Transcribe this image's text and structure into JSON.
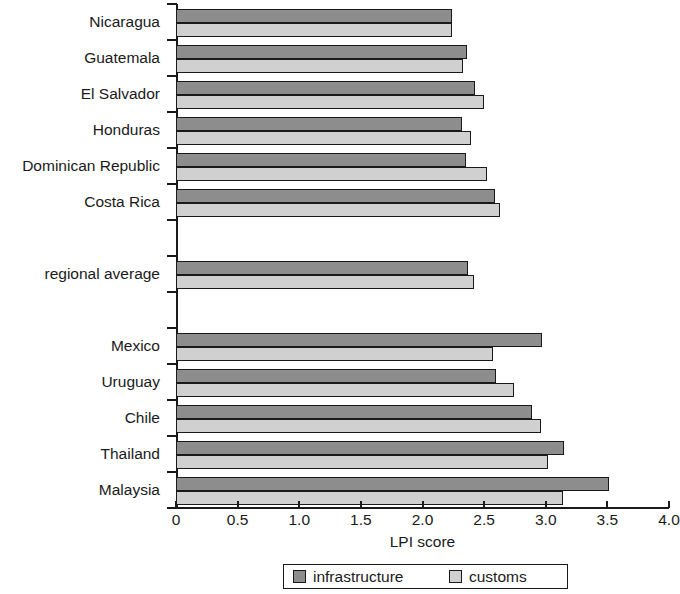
{
  "chart_data": {
    "type": "bar",
    "orientation": "horizontal",
    "title": "",
    "xlabel": "LPI score",
    "ylabel": "",
    "xlim": [
      0,
      4.0
    ],
    "xticks": [
      "0",
      "0.5",
      "1.0",
      "1.5",
      "2.0",
      "2.5",
      "3.0",
      "3.5",
      "4.0"
    ],
    "xtick_values": [
      0,
      0.5,
      1.0,
      1.5,
      2.0,
      2.5,
      3.0,
      3.5,
      4.0
    ],
    "grid": false,
    "legend_position": "bottom",
    "categories": [
      "Nicaragua",
      "Guatemala",
      "El Salvador",
      "Honduras",
      "Dominican Republic",
      "Costa Rica",
      "",
      "regional average",
      "",
      "Mexico",
      "Uruguay",
      "Chile",
      "Thailand",
      "Malaysia"
    ],
    "series": [
      {
        "name": "infrastructure",
        "color": "#8d8d8d",
        "values": [
          2.24,
          2.36,
          2.43,
          2.32,
          2.35,
          2.59,
          null,
          2.37,
          null,
          2.97,
          2.6,
          2.89,
          3.15,
          3.51
        ]
      },
      {
        "name": "customs",
        "color": "#d0d0d0",
        "values": [
          2.24,
          2.33,
          2.5,
          2.39,
          2.52,
          2.63,
          null,
          2.42,
          null,
          2.57,
          2.74,
          2.96,
          3.02,
          3.14
        ]
      }
    ]
  },
  "legend": {
    "items": [
      {
        "label": "infrastructure",
        "swatch": "infrastructure-swatch"
      },
      {
        "label": "customs",
        "swatch": "customs-swatch"
      }
    ]
  },
  "colors": {
    "infrastructure": "#8d8d8d",
    "customs": "#d0d0d0",
    "axis": "#1a1a1a",
    "background": "#ffffff"
  }
}
